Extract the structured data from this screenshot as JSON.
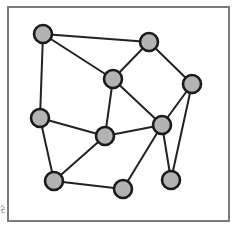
{
  "diagram": {
    "type": "undirected-graph",
    "frame": {
      "x": 8,
      "y": 7,
      "width": 221,
      "height": 214,
      "stroke": "#7a7a7a",
      "stroke_width": 2
    },
    "style": {
      "node_fill": "#b3b3b3",
      "node_stroke": "#1a1a1a",
      "node_stroke_width": 2.6,
      "node_radius": 9,
      "edge_stroke": "#222222",
      "edge_width": 2,
      "background": "#ffffff"
    },
    "nodes": [
      {
        "id": "n1",
        "x": 43,
        "y": 34
      },
      {
        "id": "n2",
        "x": 149,
        "y": 42
      },
      {
        "id": "n3",
        "x": 113,
        "y": 79
      },
      {
        "id": "n4",
        "x": 192,
        "y": 84
      },
      {
        "id": "n5",
        "x": 40,
        "y": 118
      },
      {
        "id": "n6",
        "x": 105,
        "y": 136
      },
      {
        "id": "n7",
        "x": 162,
        "y": 125
      },
      {
        "id": "n8",
        "x": 54,
        "y": 181
      },
      {
        "id": "n9",
        "x": 123,
        "y": 189
      },
      {
        "id": "n10",
        "x": 171,
        "y": 180
      }
    ],
    "edges": [
      {
        "from": "n1",
        "to": "n2"
      },
      {
        "from": "n1",
        "to": "n3"
      },
      {
        "from": "n1",
        "to": "n5"
      },
      {
        "from": "n2",
        "to": "n3"
      },
      {
        "from": "n2",
        "to": "n4"
      },
      {
        "from": "n3",
        "to": "n6"
      },
      {
        "from": "n3",
        "to": "n7"
      },
      {
        "from": "n4",
        "to": "n7"
      },
      {
        "from": "n4",
        "to": "n10"
      },
      {
        "from": "n5",
        "to": "n6"
      },
      {
        "from": "n5",
        "to": "n8"
      },
      {
        "from": "n6",
        "to": "n7"
      },
      {
        "from": "n6",
        "to": "n8"
      },
      {
        "from": "n7",
        "to": "n9"
      },
      {
        "from": "n7",
        "to": "n10"
      },
      {
        "from": "n8",
        "to": "n9"
      }
    ]
  },
  "artifact": {
    "left_edge_glyph": "谷"
  }
}
